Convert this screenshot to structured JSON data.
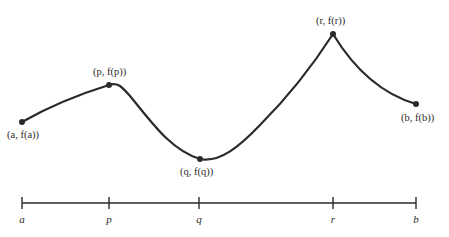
{
  "figure": {
    "points": [
      {
        "id": "a",
        "label": "(a, f(a))",
        "x": 22,
        "y": 122
      },
      {
        "id": "p",
        "label": "(p, f(p))",
        "x": 109,
        "y": 85
      },
      {
        "id": "q",
        "label": "(q, f(q))",
        "x": 200,
        "y": 159
      },
      {
        "id": "r",
        "label": "(r, f(r))",
        "x": 333,
        "y": 34
      },
      {
        "id": "b",
        "label": "(b, f(b))",
        "x": 416,
        "y": 104
      }
    ],
    "axis": {
      "ticks": [
        {
          "label": "a",
          "x": 22
        },
        {
          "label": "p",
          "x": 109
        },
        {
          "label": "q",
          "x": 199
        },
        {
          "label": "r",
          "x": 333
        },
        {
          "label": "b",
          "x": 416
        }
      ]
    },
    "colors": {
      "ink": "#2a2a2a",
      "background": "#ffffff"
    }
  }
}
